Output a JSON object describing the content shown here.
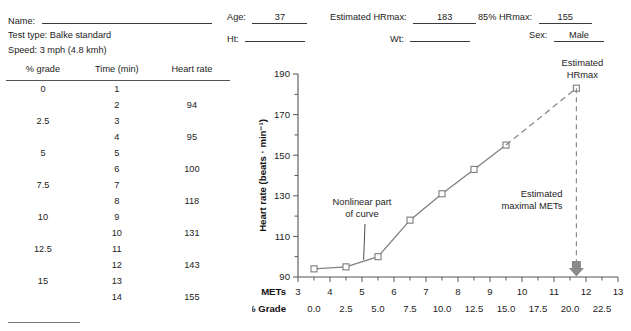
{
  "header": {
    "fields": [
      {
        "label": "Name:",
        "value": ""
      },
      {
        "label": "Test type: Balke standard",
        "value": null
      },
      {
        "label": "Speed: 3 mph (4.8 kmh)",
        "value": null
      },
      {
        "label": "Age:",
        "value": "37"
      },
      {
        "label": "Ht:",
        "value": ""
      },
      {
        "label": "Estimated HRmax:",
        "value": "183"
      },
      {
        "label": "Wt:",
        "value": ""
      },
      {
        "label": "85% HRmax:",
        "value": "155"
      },
      {
        "label": "Sex:",
        "value": "Male"
      }
    ]
  },
  "table": {
    "columns": [
      "% grade",
      "Time (min)",
      "Heart rate"
    ],
    "rows": [
      {
        "grade": "0",
        "time": "1",
        "hr": ""
      },
      {
        "grade": "",
        "time": "2",
        "hr": "94"
      },
      {
        "grade": "2.5",
        "time": "3",
        "hr": ""
      },
      {
        "grade": "",
        "time": "4",
        "hr": "95"
      },
      {
        "grade": "5",
        "time": "5",
        "hr": ""
      },
      {
        "grade": "",
        "time": "6",
        "hr": "100"
      },
      {
        "grade": "7.5",
        "time": "7",
        "hr": ""
      },
      {
        "grade": "",
        "time": "8",
        "hr": "118"
      },
      {
        "grade": "10",
        "time": "9",
        "hr": ""
      },
      {
        "grade": "",
        "time": "10",
        "hr": "131"
      },
      {
        "grade": "12.5",
        "time": "11",
        "hr": ""
      },
      {
        "grade": "",
        "time": "12",
        "hr": "143"
      },
      {
        "grade": "15",
        "time": "13",
        "hr": ""
      },
      {
        "grade": "",
        "time": "14",
        "hr": "155"
      }
    ]
  },
  "chart_data": {
    "type": "line",
    "title": "",
    "xlabel": "METs",
    "xlabel2": "% Grade",
    "ylabel": "Heart rate (beats · min⁻¹)",
    "xlim": [
      3,
      13
    ],
    "ylim": [
      90,
      190
    ],
    "grid": false,
    "legend": "none",
    "x_ticks": [
      3,
      4,
      5,
      6,
      7,
      8,
      9,
      10,
      11,
      12,
      13
    ],
    "x_tick_labels": [
      "3",
      "4",
      "5",
      "6",
      "7",
      "8",
      "9",
      "10",
      "11",
      "12",
      "13"
    ],
    "x_minor_step": 0.5,
    "x_secondary_positions": [
      3.5,
      4.5,
      5.5,
      6.5,
      7.5,
      8.5,
      9.5,
      10.5,
      11.5,
      12.5
    ],
    "x_secondary_labels": [
      "0.0",
      "2.5",
      "5.0",
      "7.5",
      "10.0",
      "12.5",
      "15.0",
      "17.5",
      "20.0",
      "22.5"
    ],
    "y_ticks": [
      90,
      100,
      110,
      120,
      130,
      140,
      150,
      160,
      170,
      180,
      190
    ],
    "y_tick_labels_shown": [
      90,
      110,
      130,
      150,
      170,
      190
    ],
    "series": [
      {
        "name": "Measured heart rate",
        "style": "solid",
        "marker": "open-square",
        "x": [
          3.5,
          4.5,
          5.5,
          6.5,
          7.5,
          8.5,
          9.5
        ],
        "y": [
          94,
          95,
          100,
          118,
          131,
          143,
          155
        ]
      },
      {
        "name": "Extrapolation to estimated HRmax",
        "style": "dashed",
        "marker": "open-square",
        "x": [
          9.5,
          11.7
        ],
        "y": [
          155,
          183
        ]
      }
    ],
    "annotations": [
      {
        "name": "nonlinear-note",
        "text_line1": "Nonlinear part",
        "text_line2": "of curve",
        "points_to_x": 5.05,
        "points_to_y": 98.5
      },
      {
        "name": "hrmax-note",
        "text_line1": "Estimated",
        "text_line2": "HRmax",
        "points_to_x": 11.7,
        "points_to_y": 183
      },
      {
        "name": "maximal-mets-note",
        "text_line1": "Estimated",
        "text_line2": "maximal METs",
        "points_to_x": 11.7,
        "points_to_y": 90
      }
    ],
    "reference_line": {
      "name": "estimated-maximal-mets-line",
      "x": 11.7,
      "from_y": 183,
      "to_y": 90,
      "style": "dashed",
      "arrow": "down"
    }
  }
}
